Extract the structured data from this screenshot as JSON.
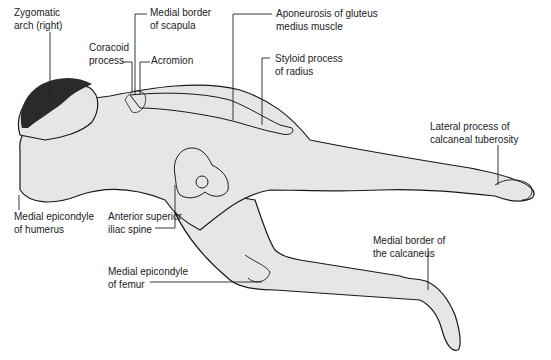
{
  "figure": {
    "colors": {
      "body_fill": "#e6e6e6",
      "outline": "#1a1a1a",
      "hair": "#2a2a2a",
      "leader_line": "#222222"
    }
  },
  "labels": [
    {
      "id": "zygomatic-arch",
      "line1": "Zygomatic",
      "line2": "arch (right)"
    },
    {
      "id": "medial-border-scapula",
      "line1": "Medial border",
      "line2": "of scapula"
    },
    {
      "id": "coracoid-process",
      "line1": "Coracoid",
      "line2": "process"
    },
    {
      "id": "acromion",
      "line1": "Acromion",
      "line2": ""
    },
    {
      "id": "aponeurosis-gluteus-medius",
      "line1": "Aponeurosis of gluteus",
      "line2": "medius muscle"
    },
    {
      "id": "styloid-process-radius",
      "line1": "Styloid process",
      "line2": "of radius"
    },
    {
      "id": "lateral-process-calcaneal-tuberosity",
      "line1": "Lateral process of",
      "line2": "calcaneal tuberosity"
    },
    {
      "id": "medial-epicondyle-humerus",
      "line1": "Medial epicondyle",
      "line2": "of humerus"
    },
    {
      "id": "anterior-superior-iliac-spine",
      "line1": "Anterior superior",
      "line2": "iliac spine"
    },
    {
      "id": "medial-border-calcaneus",
      "line1": "Medial border of",
      "line2": "the calcaneus"
    },
    {
      "id": "medial-epicondyle-femur",
      "line1": "Medial epicondyle",
      "line2": "of femur"
    }
  ]
}
